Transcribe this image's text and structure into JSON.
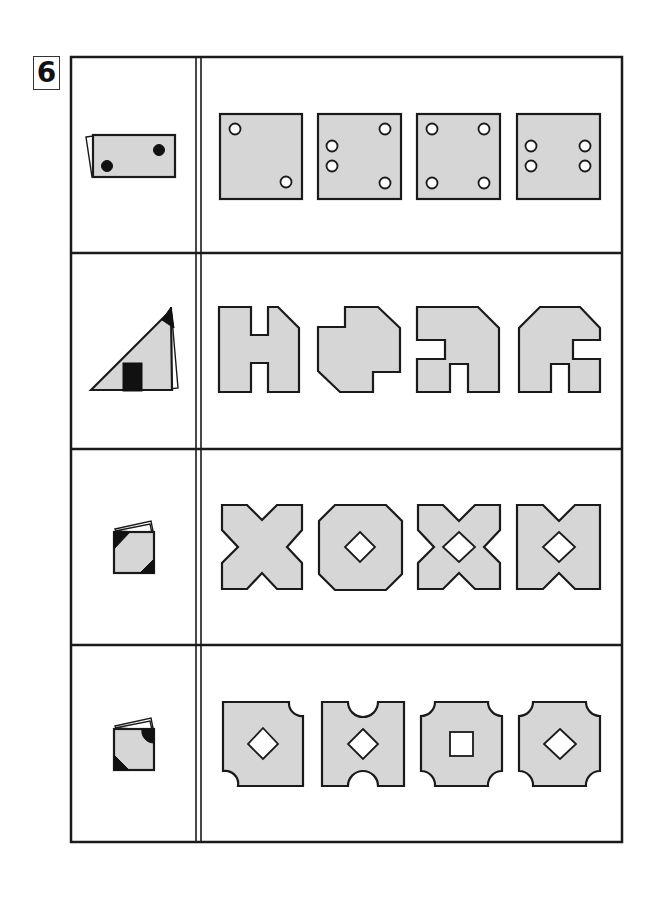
{
  "problem": {
    "number": "6",
    "type": "paper folding and punching puzzle",
    "columns": [
      "folded paper",
      "unfolded answer choices"
    ],
    "rows": [
      {
        "question": "rectangle folded in half with two punched holes",
        "choices": [
          "square with 2 holes at opposite corners",
          "square with 4 holes: 2 left-middle, 2 right corners",
          "square with 4 holes at corners",
          "square with 4 holes: 2 left-middle, 2 right-middle"
        ]
      },
      {
        "question": "triangle fold with black corner cut and black rectangular notch",
        "choices": [
          "H-shaped figure with cut top-right corner",
          "octagonal blob with notch top-left and bottom-right",
          "figure with left notch and bottom notch",
          "figure with right notch and bottom notch"
        ]
      },
      {
        "question": "square folded multiple times with two black triangular corner cuts",
        "choices": [
          "X-shape without center hole",
          "octagon with diamond center hole",
          "X-shape with diamond center hole",
          "bowtie shape with diamond center hole"
        ]
      },
      {
        "question": "square folded multiple times with a round corner cut and a triangular corner cut",
        "choices": [
          "square with two rounded corners and diamond hole",
          "square with semicircle notches top and bottom and diamond hole",
          "square with four rounded corners and square hole",
          "square with four rounded corners and diamond hole"
        ]
      }
    ]
  },
  "colors": {
    "fill": "#d6d6d6",
    "stroke": "#1a1a1a",
    "cut": "#111111",
    "background": "#ffffff"
  }
}
